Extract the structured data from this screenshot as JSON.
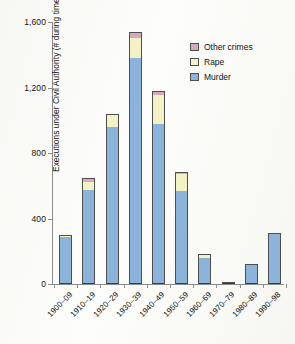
{
  "chart_data": {
    "type": "bar",
    "subtype": "stacked-bar",
    "title": "",
    "xlabel": "",
    "ylabel": "Executions under Civil Authority (# during time period by type of conviction)",
    "ylim": [
      0,
      1600
    ],
    "yticks": [
      0,
      400,
      800,
      1200,
      1600
    ],
    "ytick_labels": [
      "0",
      "400",
      "800",
      "1,200",
      "1,600"
    ],
    "grid": false,
    "legend_position": "upper right",
    "categories": [
      "1900–09",
      "1910–19",
      "1920–29",
      "1930–39",
      "1940–49",
      "1950–59",
      "1960–69",
      "1970–79",
      "1980–89",
      "1990–98"
    ],
    "series": [
      {
        "name": "Murder",
        "color": "#8cb4da",
        "values": [
          285,
          575,
          960,
          1380,
          980,
          565,
          160,
          8,
          120,
          310
        ]
      },
      {
        "name": "Rape",
        "color": "#f4f2c4",
        "values": [
          5,
          45,
          70,
          120,
          175,
          105,
          15,
          0,
          0,
          0
        ]
      },
      {
        "name": "Other crimes",
        "color": "#d9a8bd",
        "values": [
          8,
          25,
          10,
          40,
          25,
          15,
          5,
          0,
          0,
          0
        ]
      }
    ],
    "totals": [
      298,
      645,
      1040,
      1540,
      1180,
      685,
      180,
      8,
      120,
      310
    ]
  },
  "legend": {
    "items": [
      {
        "label": "Other crimes",
        "color": "#d9a8bd"
      },
      {
        "label": "Rape",
        "color": "#f4f2c4"
      },
      {
        "label": "Murder",
        "color": "#8cb4da"
      }
    ]
  }
}
